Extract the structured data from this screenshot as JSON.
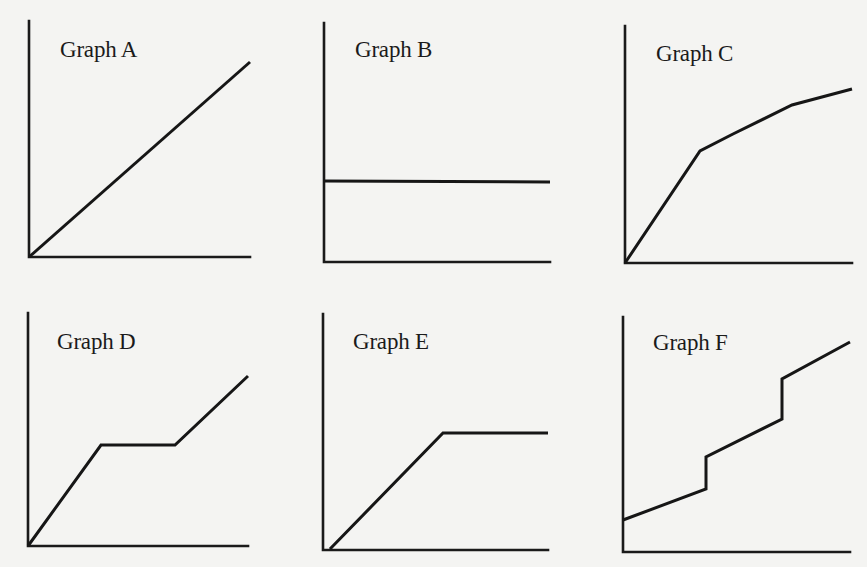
{
  "page": {
    "background": "#f4f4f2",
    "ink": "#161616"
  },
  "chart_data": [
    {
      "id": "A",
      "type": "line",
      "title": "Graph A",
      "xlabel": "",
      "ylabel": "",
      "grid": false,
      "shape": "straight line rising from origin",
      "x": [
        0,
        1
      ],
      "y": [
        0,
        0.83
      ],
      "title_pos": [
        60,
        38
      ],
      "axes": {
        "ox": 29,
        "oy": 257,
        "top": 21,
        "right": 250
      },
      "points_px": [
        [
          29,
          257
        ],
        [
          250,
          62
        ]
      ]
    },
    {
      "id": "B",
      "type": "line",
      "title": "Graph B",
      "xlabel": "",
      "ylabel": "",
      "grid": false,
      "shape": "horizontal constant line",
      "x": [
        0,
        1
      ],
      "y": [
        0.34,
        0.34
      ],
      "title_pos": [
        355,
        38
      ],
      "axes": {
        "ox": 324,
        "oy": 262,
        "top": 23,
        "right": 550
      },
      "points_px": [
        [
          324,
          181
        ],
        [
          550,
          182
        ]
      ]
    },
    {
      "id": "C",
      "type": "line",
      "title": "Graph C",
      "xlabel": "",
      "ylabel": "",
      "grid": false,
      "shape": "steep rise then decreasing slope (concave)",
      "x": [
        0,
        0.33,
        0.48,
        0.74,
        1
      ],
      "y": [
        0,
        0.47,
        0.54,
        0.67,
        0.73
      ],
      "title_pos": [
        656,
        42
      ],
      "axes": {
        "ox": 625,
        "oy": 263,
        "top": 26,
        "right": 852
      },
      "points_px": [
        [
          625,
          263
        ],
        [
          700,
          151
        ],
        [
          733,
          134
        ],
        [
          792,
          105
        ],
        [
          852,
          89
        ]
      ]
    },
    {
      "id": "D",
      "type": "line",
      "title": "Graph D",
      "xlabel": "",
      "ylabel": "",
      "grid": false,
      "shape": "rise, plateau, rise",
      "x": [
        0,
        0.33,
        0.67,
        1
      ],
      "y": [
        0,
        0.43,
        0.43,
        0.73
      ],
      "title_pos": [
        57,
        330
      ],
      "axes": {
        "ox": 28,
        "oy": 546,
        "top": 313,
        "right": 248
      },
      "points_px": [
        [
          28,
          546
        ],
        [
          101,
          445
        ],
        [
          175,
          445
        ],
        [
          248,
          376
        ]
      ]
    },
    {
      "id": "E",
      "type": "line",
      "title": "Graph E",
      "xlabel": "",
      "ylabel": "",
      "grid": false,
      "shape": "rise then plateau",
      "x": [
        0.03,
        0.53,
        1
      ],
      "y": [
        0,
        0.49,
        0.49
      ],
      "title_pos": [
        353,
        330
      ],
      "axes": {
        "ox": 323,
        "oy": 550,
        "top": 314,
        "right": 548
      },
      "points_px": [
        [
          330,
          549
        ],
        [
          443,
          433
        ],
        [
          548,
          433
        ]
      ]
    },
    {
      "id": "F",
      "type": "line",
      "title": "Graph F",
      "xlabel": "",
      "ylabel": "",
      "grid": false,
      "shape": "nonzero intercept, rising with two vertical step jumps",
      "x": [
        0,
        0.37,
        0.37,
        0.7,
        0.7,
        1
      ],
      "y": [
        0.14,
        0.27,
        0.41,
        0.57,
        0.74,
        0.9
      ],
      "title_pos": [
        653,
        331
      ],
      "axes": {
        "ox": 623,
        "oy": 552,
        "top": 317,
        "right": 850
      },
      "points_px": [
        [
          623,
          520
        ],
        [
          706,
          489
        ],
        [
          706,
          457
        ],
        [
          782,
          419
        ],
        [
          782,
          379
        ],
        [
          850,
          342
        ]
      ]
    }
  ]
}
